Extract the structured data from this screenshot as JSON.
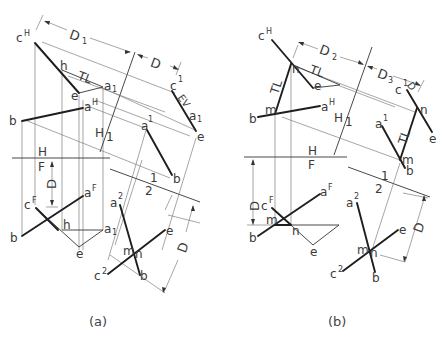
{
  "figure": {
    "panels": [
      {
        "id": "a",
        "caption": "(a)",
        "fold_lines": {
          "HF_top": "H",
          "HF_bottom": "F",
          "H1_left": "H",
          "H1_right": "1",
          "12_top": "1",
          "12_bottom": "2"
        },
        "dimensions": {
          "D1_top": "D",
          "D1_top_sub": "1",
          "D": "D",
          "D_front": "D",
          "D1_right": "D",
          "D1_right_sub": "1"
        },
        "top_view": {
          "cH": "c",
          "cH_sup": "H",
          "h": "h",
          "e": "e",
          "a1": "a",
          "a1_sub": "1",
          "aH": "a",
          "aH_sup": "H",
          "b": "b",
          "TL": "TL"
        },
        "aux1_view": {
          "c1": "c",
          "c1_sup": "1",
          "EV": "EV",
          "a1": "a",
          "a1_sub": "1",
          "e": "e",
          "a": "a",
          "a_sup": "1",
          "b": "b"
        },
        "front_view": {
          "cF": "c",
          "cF_sup": "F",
          "aF": "a",
          "aF_sup": "F",
          "b": "b",
          "h": "h",
          "a1": "a",
          "a1_sub": "1",
          "e": "e"
        },
        "aux2_view": {
          "a2": "a",
          "a2_sup": "2",
          "e": "e",
          "m": "m",
          "n": "n",
          "c2": "c",
          "c2_sup": "2",
          "b": "b"
        }
      },
      {
        "id": "b",
        "caption": "(b)",
        "fold_lines": {
          "HF_top": "H",
          "HF_bottom": "F",
          "H1_left": "H",
          "H1_right": "1",
          "12_top": "1",
          "12_bottom": "2"
        },
        "dimensions": {
          "D2": "D",
          "D2_sub": "2",
          "D3": "D",
          "D3_sub": "3",
          "D3_front": "D",
          "D3_front_sub": "3",
          "D2_right": "D",
          "D2_right_sub": "2",
          "D_small": "D",
          "D_small_sub": "2"
        },
        "top_view": {
          "cH": "c",
          "cH_sup": "H",
          "n": "n",
          "TL_top": "TL",
          "TL_left": "TL",
          "e": "e",
          "m": "m",
          "b": "b",
          "aH": "a",
          "aH_sup": "H"
        },
        "aux1_view": {
          "c1": "c",
          "c1_sup": "1",
          "n": "n",
          "e": "e",
          "a1": "a",
          "a1_sup": "1",
          "TL": "TL",
          "m": "m",
          "b": "b"
        },
        "front_view": {
          "cF": "c",
          "cF_sup": "F",
          "aF": "a",
          "aF_sup": "F",
          "m": "m",
          "n": "n",
          "b": "b",
          "e": "e"
        },
        "aux2_view": {
          "a2": "a",
          "a2_sup": "2",
          "e": "e",
          "m": "m",
          "n": "n",
          "c2": "c",
          "c2_sup": "2",
          "b": "b"
        }
      }
    ]
  },
  "colors": {
    "line": "#1e1e1e",
    "projector": "#6a6a6a",
    "text": "#3a3a3a",
    "background": "#ffffff"
  }
}
